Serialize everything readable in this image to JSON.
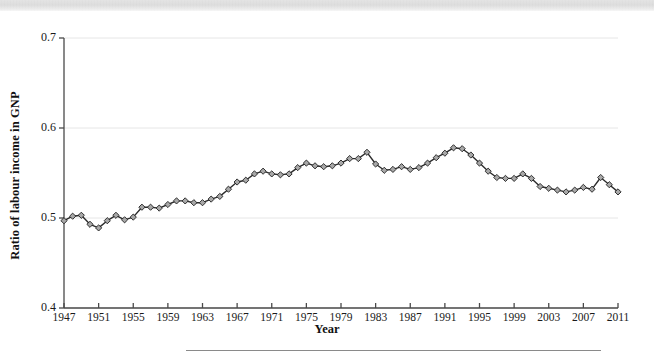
{
  "figure": {
    "background_color": "#ffffff",
    "scan_band_color": "#d4d4d4",
    "line_color": "#2b2b2b",
    "marker_fill": "#a8a8a8",
    "marker_stroke": "#1f1f1f",
    "axis_color": "#4a4a4a",
    "grid_color": "#e6e6e6",
    "rule_color": "#8a8a8a"
  },
  "axis": {
    "ylabel": "Ratio of labour income in GNP",
    "xlabel": "Year",
    "ytick_labels": [
      "0.7",
      "0.6",
      "0.5",
      "0.4"
    ],
    "xtick_labels": [
      "1947",
      "1951",
      "1955",
      "1959",
      "1963",
      "1967",
      "1971",
      "1975",
      "1979",
      "1983",
      "1987",
      "1991",
      "1995",
      "1999",
      "2003",
      "2007",
      "2011"
    ]
  },
  "chart_data": {
    "type": "line",
    "title": "",
    "xlabel": "Year",
    "ylabel": "Ratio of labour income in GNP",
    "xlim": [
      1947,
      2011
    ],
    "ylim": [
      0.4,
      0.7
    ],
    "yticks": [
      0.4,
      0.5,
      0.6,
      0.7
    ],
    "xticks": [
      1947,
      1951,
      1955,
      1959,
      1963,
      1967,
      1971,
      1975,
      1979,
      1983,
      1987,
      1991,
      1995,
      1999,
      2003,
      2007,
      2011
    ],
    "grid": "horizontal",
    "legend": "none",
    "marker": "diamond",
    "series": [
      {
        "name": "Ratio of labour income in GNP",
        "x": [
          1947,
          1948,
          1949,
          1950,
          1951,
          1952,
          1953,
          1954,
          1955,
          1956,
          1957,
          1958,
          1959,
          1960,
          1961,
          1962,
          1963,
          1964,
          1965,
          1966,
          1967,
          1968,
          1969,
          1970,
          1971,
          1972,
          1973,
          1974,
          1975,
          1976,
          1977,
          1978,
          1979,
          1980,
          1981,
          1982,
          1983,
          1984,
          1985,
          1986,
          1987,
          1988,
          1989,
          1990,
          1991,
          1992,
          1993,
          1994,
          1995,
          1996,
          1997,
          1998,
          1999,
          2000,
          2001,
          2002,
          2003,
          2004,
          2005,
          2006,
          2007,
          2008,
          2009,
          2010,
          2011
        ],
        "values": [
          0.497,
          0.502,
          0.503,
          0.493,
          0.489,
          0.497,
          0.503,
          0.498,
          0.501,
          0.512,
          0.512,
          0.511,
          0.515,
          0.519,
          0.519,
          0.517,
          0.517,
          0.521,
          0.524,
          0.532,
          0.54,
          0.542,
          0.549,
          0.552,
          0.549,
          0.548,
          0.549,
          0.556,
          0.561,
          0.558,
          0.557,
          0.558,
          0.561,
          0.566,
          0.566,
          0.573,
          0.56,
          0.553,
          0.554,
          0.557,
          0.554,
          0.556,
          0.561,
          0.567,
          0.572,
          0.578,
          0.577,
          0.57,
          0.561,
          0.552,
          0.545,
          0.544,
          0.544,
          0.549,
          0.544,
          0.535,
          0.533,
          0.531,
          0.529,
          0.531,
          0.534,
          0.532,
          0.545,
          0.537,
          0.529
        ]
      }
    ]
  }
}
